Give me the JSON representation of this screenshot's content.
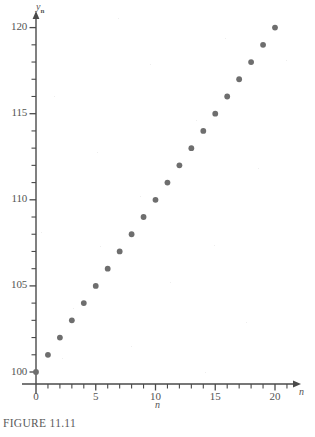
{
  "figure": {
    "caption": "FIGURE 11.11",
    "y_axis_name": "y",
    "y_axis_subscript": "n",
    "x_axis_name": "n",
    "x_axis_caption_name": "n"
  },
  "colors": {
    "point": "#6e6e6e",
    "axis": "#4a4a4a",
    "text": "#545454",
    "background": "#ffffff"
  },
  "chart_data": {
    "type": "scatter",
    "title": "",
    "xlabel": "n",
    "ylabel": "y_n",
    "xlim": [
      0,
      21.5
    ],
    "ylim": [
      99.2,
      120.8
    ],
    "grid": false,
    "legend": null,
    "x_ticks_major": [
      0,
      5,
      10,
      15,
      20
    ],
    "x_tick_labels": [
      "0",
      "5",
      "10",
      "15",
      "20"
    ],
    "x_ticks_minor_step": 1,
    "y_ticks_major": [
      100,
      105,
      110,
      115,
      120
    ],
    "y_tick_labels": [
      "100",
      "105",
      "110",
      "115",
      "120"
    ],
    "y_ticks_minor_step": 1,
    "x": [
      0,
      1,
      2,
      3,
      4,
      5,
      6,
      7,
      8,
      9,
      10,
      11,
      12,
      13,
      14,
      15,
      16,
      17,
      18,
      19,
      20
    ],
    "values": [
      100,
      101,
      102,
      103,
      104,
      105,
      106,
      107,
      108,
      109,
      110,
      111,
      112,
      113,
      114,
      115,
      116,
      117,
      118,
      119,
      120
    ],
    "series": [
      {
        "name": "y_n",
        "x": [
          0,
          1,
          2,
          3,
          4,
          5,
          6,
          7,
          8,
          9,
          10,
          11,
          12,
          13,
          14,
          15,
          16,
          17,
          18,
          19,
          20
        ],
        "values": [
          100,
          101,
          102,
          103,
          104,
          105,
          106,
          107,
          108,
          109,
          110,
          111,
          112,
          113,
          114,
          115,
          116,
          117,
          118,
          119,
          120
        ]
      }
    ]
  }
}
